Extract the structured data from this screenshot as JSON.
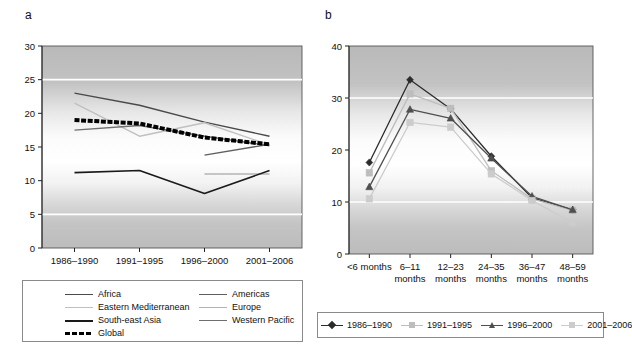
{
  "figure": {
    "panel_a_letter": "a",
    "panel_b_letter": "b"
  },
  "panel_a": {
    "legend": {
      "items": [
        {
          "label": "Africa",
          "color": "#4a4a4a",
          "width": 1.4,
          "dashed": false
        },
        {
          "label": "Americas",
          "color": "#5e5e5e",
          "width": 1.4,
          "dashed": false
        },
        {
          "label": "Eastern Mediterranean",
          "color": "#c0c0c0",
          "width": 1.4,
          "dashed": false
        },
        {
          "label": "Europe",
          "color": "#b4b4b4",
          "width": 1.4,
          "dashed": false
        },
        {
          "label": "South-east Asia",
          "color": "#1a1a1a",
          "width": 1.6,
          "dashed": false
        },
        {
          "label": "Western Pacific",
          "color": "#6e6e6e",
          "width": 1.4,
          "dashed": false
        },
        {
          "label": "Global",
          "color": "#000000",
          "width": 4.0,
          "dashed": true
        }
      ]
    }
  },
  "panel_b": {
    "legend": {
      "items": [
        {
          "label": "1986–1990",
          "color": "#2b2b2b",
          "marker": "diamond"
        },
        {
          "label": "1991–1995",
          "color": "#bdbdbd",
          "marker": "square"
        },
        {
          "label": "1996–2000",
          "color": "#4f4f4f",
          "marker": "triangle"
        },
        {
          "label": "2001–2006",
          "color": "#cccccc",
          "marker": "square"
        }
      ]
    }
  },
  "chart_data": [
    {
      "id": "panel-a",
      "type": "line",
      "title": "",
      "xlabel": "",
      "ylabel": "",
      "categories": [
        "1986–1990",
        "1991–1995",
        "1996–2000",
        "2001–2006"
      ],
      "ylim": [
        0,
        30
      ],
      "yticks": [
        0,
        5,
        10,
        15,
        20,
        25,
        30
      ],
      "grid": true,
      "gridlines_at": [
        5,
        25
      ],
      "legend_position": "below",
      "series": [
        {
          "name": "Africa",
          "color": "#4a4a4a",
          "width": 1.4,
          "dashed": false,
          "values": [
            23.0,
            21.2,
            18.7,
            16.6
          ]
        },
        {
          "name": "Americas",
          "color": "#5e5e5e",
          "width": 1.4,
          "dashed": false,
          "values": [
            null,
            null,
            13.8,
            15.4
          ]
        },
        {
          "name": "Eastern Mediterranean",
          "color": "#c0c0c0",
          "width": 1.4,
          "dashed": false,
          "values": [
            21.5,
            16.6,
            18.6,
            15.3
          ]
        },
        {
          "name": "Europe",
          "color": "#b4b4b4",
          "width": 1.4,
          "dashed": false,
          "values": [
            null,
            null,
            11.0,
            11.0
          ]
        },
        {
          "name": "South-east Asia",
          "color": "#1a1a1a",
          "width": 1.6,
          "dashed": false,
          "values": [
            11.2,
            11.5,
            8.1,
            11.5
          ]
        },
        {
          "name": "Western Pacific",
          "color": "#6e6e6e",
          "width": 1.4,
          "dashed": false,
          "values": [
            17.5,
            18.2,
            16.6,
            15.2
          ]
        },
        {
          "name": "Global",
          "color": "#000000",
          "width": 4.0,
          "dashed": true,
          "values": [
            19.0,
            18.5,
            16.4,
            15.4
          ]
        }
      ]
    },
    {
      "id": "panel-b",
      "type": "line",
      "title": "",
      "xlabel": "",
      "ylabel": "",
      "categories": [
        "<6 months",
        "6–11 months",
        "12–23 months",
        "24–35 months",
        "36–47 months",
        "48–59 months"
      ],
      "category_lines": [
        [
          "<6 months",
          ""
        ],
        [
          "6–11",
          "months"
        ],
        [
          "12–23",
          "months"
        ],
        [
          "24–35",
          "months"
        ],
        [
          "36–47",
          "months"
        ],
        [
          "48–59",
          "months"
        ]
      ],
      "ylim": [
        0,
        40
      ],
      "yticks": [
        0,
        10,
        20,
        30,
        40
      ],
      "grid": true,
      "gridlines_at": [
        10,
        30
      ],
      "legend_position": "below",
      "series": [
        {
          "name": "1986–1990",
          "color": "#2b2b2b",
          "marker": "diamond",
          "values": [
            17.6,
            33.5,
            27.9,
            18.8,
            10.8,
            8.5
          ]
        },
        {
          "name": "1991–1995",
          "color": "#bdbdbd",
          "marker": "square",
          "values": [
            15.6,
            30.8,
            28.0,
            16.0,
            10.6,
            8.4
          ]
        },
        {
          "name": "1996–2000",
          "color": "#4f4f4f",
          "marker": "triangle",
          "values": [
            12.9,
            27.8,
            26.1,
            18.4,
            11.1,
            8.5
          ]
        },
        {
          "name": "2001–2006",
          "color": "#cccccc",
          "marker": "square",
          "values": [
            10.6,
            25.3,
            24.4,
            15.4,
            10.3,
            6.0
          ]
        }
      ]
    }
  ]
}
